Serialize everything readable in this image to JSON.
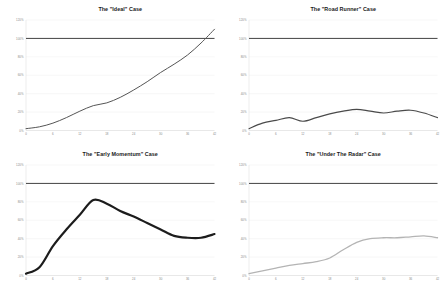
{
  "figure": {
    "background": "#ffffff",
    "layout": "2x2 grid of line charts"
  },
  "chart_data": [
    {
      "type": "line",
      "title": "The \"Ideal\" Case",
      "xlabel": "",
      "ylabel": "",
      "xlim": [
        0,
        42
      ],
      "ylim": [
        0,
        120
      ],
      "grid": true,
      "legend": "none",
      "yticks": [
        "0%",
        "20%",
        "40%",
        "60%",
        "80%",
        "100%",
        "120%"
      ],
      "xticks": [
        "0",
        "6",
        "12",
        "18",
        "24",
        "30",
        "36",
        "42"
      ],
      "goal_line": {
        "value": 100,
        "label": "100% goal",
        "color": "#3a3a3a"
      },
      "series": [
        {
          "name": "Ideal",
          "color": "#555555",
          "width": 1.0,
          "x": [
            0,
            3,
            6,
            9,
            12,
            15,
            18,
            21,
            24,
            27,
            30,
            33,
            36,
            39,
            42
          ],
          "values": [
            2,
            4,
            8,
            14,
            21,
            27,
            30,
            36,
            44,
            53,
            63,
            72,
            82,
            95,
            110
          ]
        }
      ]
    },
    {
      "type": "line",
      "title": "The \"Road Runner\" Case",
      "xlabel": "",
      "ylabel": "",
      "xlim": [
        0,
        42
      ],
      "ylim": [
        0,
        120
      ],
      "grid": true,
      "legend": "none",
      "yticks": [
        "0%",
        "20%",
        "40%",
        "60%",
        "80%",
        "100%",
        "120%"
      ],
      "xticks": [
        "0",
        "6",
        "12",
        "18",
        "24",
        "30",
        "36",
        "42"
      ],
      "goal_line": {
        "value": 100,
        "label": "100% goal",
        "color": "#3a3a3a"
      },
      "series": [
        {
          "name": "Road Runner",
          "color": "#4a4a4a",
          "width": 1.15,
          "x": [
            0,
            3,
            6,
            9,
            12,
            15,
            18,
            21,
            24,
            27,
            30,
            33,
            36,
            39,
            42
          ],
          "values": [
            2,
            8,
            11,
            14,
            10,
            14,
            18,
            21,
            23,
            21,
            19,
            21,
            22,
            19,
            14
          ]
        }
      ]
    },
    {
      "type": "line",
      "title": "The \"Early Momentum\" Case",
      "xlabel": "",
      "ylabel": "",
      "xlim": [
        0,
        42
      ],
      "ylim": [
        0,
        120
      ],
      "grid": true,
      "legend": "none",
      "yticks": [
        "0%",
        "20%",
        "40%",
        "60%",
        "80%",
        "100%",
        "120%"
      ],
      "xticks": [
        "0",
        "6",
        "12",
        "18",
        "24",
        "30",
        "36",
        "42"
      ],
      "goal_line": {
        "value": 100,
        "label": "100% goal",
        "color": "#555555"
      },
      "series": [
        {
          "name": "Early Momentum",
          "color": "#1c1c1c",
          "width": 2.2,
          "x": [
            0,
            3,
            6,
            9,
            12,
            15,
            18,
            21,
            24,
            27,
            30,
            33,
            36,
            39,
            42
          ],
          "values": [
            2,
            9,
            32,
            50,
            66,
            82,
            78,
            70,
            64,
            57,
            50,
            43,
            41,
            41,
            45
          ]
        }
      ]
    },
    {
      "type": "line",
      "title": "The \"Under The Radar\" Case",
      "xlabel": "",
      "ylabel": "",
      "xlim": [
        0,
        42
      ],
      "ylim": [
        0,
        120
      ],
      "grid": true,
      "legend": "none",
      "yticks": [
        "0%",
        "20%",
        "40%",
        "60%",
        "80%",
        "100%",
        "120%"
      ],
      "xticks": [
        "0",
        "6",
        "12",
        "18",
        "24",
        "30",
        "36",
        "42"
      ],
      "goal_line": {
        "value": 100,
        "label": "100% goal",
        "color": "#3a3a3a"
      },
      "series": [
        {
          "name": "Under The Radar",
          "color": "#b4b4b4",
          "width": 1.3,
          "x": [
            0,
            3,
            6,
            9,
            12,
            15,
            18,
            21,
            24,
            27,
            30,
            33,
            36,
            39,
            42
          ],
          "values": [
            2,
            5,
            8,
            11,
            13,
            15,
            19,
            28,
            36,
            40,
            41,
            41,
            42,
            43,
            41
          ]
        }
      ]
    }
  ]
}
